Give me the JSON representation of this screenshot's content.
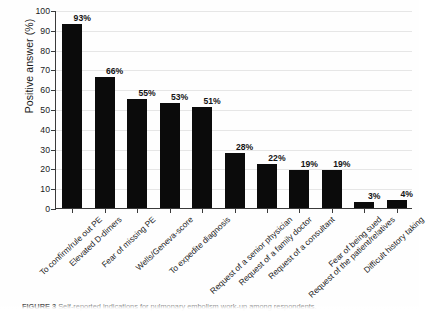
{
  "chart_data": {
    "type": "bar",
    "title": "",
    "xlabel": "",
    "ylabel": "Positive answer (%)",
    "ylim": [
      0,
      100
    ],
    "ytick_step": 10,
    "yticks": [
      0,
      10,
      20,
      30,
      40,
      50,
      60,
      70,
      80,
      90,
      100
    ],
    "grid": true,
    "legend": "none",
    "bar_color": "#0b0b0b",
    "categories": [
      "To confirm/rule out PE",
      "Elevated D-dimers",
      "Fear of missing PE",
      "Wells/Geneva-score",
      "To expedite diagnosis",
      "Request of a senior physician",
      "Request of a family doctor",
      "Request of a consultant",
      "Request of the patient/relatives",
      "Fear of being sued",
      "Difficult history taking"
    ],
    "values": [
      93,
      66,
      55,
      53,
      51,
      28,
      22,
      19,
      19,
      3,
      4
    ],
    "data_labels": [
      "93%",
      "66%",
      "55%",
      "53%",
      "51%",
      "28%",
      "22%",
      "19%",
      "19%",
      "3%",
      "4%"
    ]
  },
  "caption": {
    "prefix": "FIGURE 3",
    "text": "Self-reported indications for pulmonary embolism work-up among respondents."
  }
}
